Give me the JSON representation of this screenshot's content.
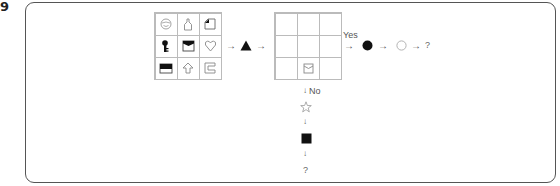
{
  "question": {
    "number": "9"
  },
  "input_grid": {
    "cells": [
      {
        "icon": "smiley-circle-icon"
      },
      {
        "icon": "bottle-icon"
      },
      {
        "icon": "folded-corner-square-icon"
      },
      {
        "icon": "key-icon"
      },
      {
        "icon": "envelope-box-filled-top-icon"
      },
      {
        "icon": "heart-outline-icon"
      },
      {
        "icon": "half-filled-rectangle-icon"
      },
      {
        "icon": "up-arrow-outline-icon"
      },
      {
        "icon": "bracket-c-icon"
      }
    ]
  },
  "operation": {
    "icon": "black-triangle-icon"
  },
  "output_grid": {
    "cells": [
      {
        "icon": ""
      },
      {
        "icon": ""
      },
      {
        "icon": ""
      },
      {
        "icon": ""
      },
      {
        "icon": ""
      },
      {
        "icon": ""
      },
      {
        "icon": ""
      },
      {
        "icon": "envelope-outline-icon"
      },
      {
        "icon": ""
      }
    ]
  },
  "branch_yes": {
    "label": "Yes",
    "steps": [
      "black-circle-icon",
      "white-circle-icon"
    ],
    "result": "?"
  },
  "branch_no": {
    "label": "No",
    "steps": [
      "white-star-icon",
      "black-square-icon"
    ],
    "result": "?"
  },
  "arrow_glyph": "→",
  "down_arrow_glyph": "↓"
}
